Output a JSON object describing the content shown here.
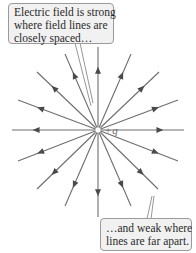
{
  "diagram": {
    "charge": {
      "sign": "+",
      "symbol": "q",
      "center": [
        98,
        130
      ]
    },
    "field_line_color": "#6e6e6e",
    "arrow_color": "#4a4a4a",
    "field_lines": [
      {
        "end": [
          98,
          47
        ]
      },
      {
        "end": [
          131,
          54
        ]
      },
      {
        "end": [
          65,
          54
        ]
      },
      {
        "end": [
          159,
          72
        ]
      },
      {
        "end": [
          37,
          72
        ]
      },
      {
        "end": [
          178,
          100
        ]
      },
      {
        "end": [
          18,
          100
        ]
      },
      {
        "end": [
          184,
          130
        ]
      },
      {
        "end": [
          12,
          130
        ]
      },
      {
        "end": [
          178,
          161
        ]
      },
      {
        "end": [
          18,
          161
        ]
      },
      {
        "end": [
          158,
          189
        ]
      },
      {
        "end": [
          37,
          189
        ]
      },
      {
        "end": [
          131,
          206
        ]
      },
      {
        "end": [
          65,
          206
        ]
      },
      {
        "end": [
          98,
          217
        ]
      }
    ],
    "callouts": {
      "top": {
        "lines": [
          "Electric field is strong",
          "where field lines are",
          "closely spaced…"
        ]
      },
      "bottom": {
        "lines": [
          "…and weak where",
          "lines are far apart."
        ]
      }
    }
  }
}
